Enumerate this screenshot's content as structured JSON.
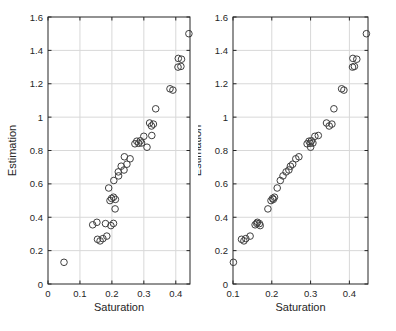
{
  "figure": {
    "background": "#ffffff",
    "title": ""
  },
  "colors": {
    "axis": "#262626",
    "tick_label": "#262626",
    "grid": "#d8d8d8",
    "marker_edge": "#3f3f3f",
    "plot_background": "#ffffff"
  },
  "chart_data": [
    {
      "type": "scatter",
      "title": "",
      "xlabel": "Saturation",
      "ylabel": "Estimation",
      "xlim": [
        0,
        0.4445
      ],
      "ylim": [
        0,
        1.6
      ],
      "xticks": [
        0,
        0.1,
        0.2,
        0.3,
        0.4
      ],
      "xticklabels": [
        "0",
        "0.1",
        "0.2",
        "0.3",
        "0.4"
      ],
      "yticks": [
        0,
        0.2,
        0.4,
        0.6,
        0.8,
        1.0,
        1.2,
        1.4,
        1.6
      ],
      "yticklabels": [
        "0",
        "0.2",
        "0.4",
        "0.6",
        "0.8",
        "1",
        "1.2",
        "1.4",
        "1.6"
      ],
      "grid": true,
      "legend": null,
      "marker": "open-circle",
      "points": [
        [
          0.05,
          0.13
        ],
        [
          0.163,
          0.258
        ],
        [
          0.155,
          0.268
        ],
        [
          0.172,
          0.272
        ],
        [
          0.184,
          0.287
        ],
        [
          0.14,
          0.355
        ],
        [
          0.153,
          0.37
        ],
        [
          0.18,
          0.362
        ],
        [
          0.197,
          0.35
        ],
        [
          0.205,
          0.363
        ],
        [
          0.21,
          0.45
        ],
        [
          0.194,
          0.5
        ],
        [
          0.199,
          0.513
        ],
        [
          0.205,
          0.52
        ],
        [
          0.211,
          0.507
        ],
        [
          0.19,
          0.575
        ],
        [
          0.206,
          0.62
        ],
        [
          0.221,
          0.648
        ],
        [
          0.22,
          0.672
        ],
        [
          0.238,
          0.683
        ],
        [
          0.229,
          0.706
        ],
        [
          0.247,
          0.718
        ],
        [
          0.257,
          0.75
        ],
        [
          0.239,
          0.762
        ],
        [
          0.272,
          0.84
        ],
        [
          0.278,
          0.856
        ],
        [
          0.284,
          0.843
        ],
        [
          0.289,
          0.858
        ],
        [
          0.293,
          0.845
        ],
        [
          0.31,
          0.82
        ],
        [
          0.3,
          0.885
        ],
        [
          0.325,
          0.89
        ],
        [
          0.318,
          0.965
        ],
        [
          0.324,
          0.947
        ],
        [
          0.33,
          0.958
        ],
        [
          0.337,
          1.05
        ],
        [
          0.382,
          1.17
        ],
        [
          0.391,
          1.162
        ],
        [
          0.408,
          1.352
        ],
        [
          0.418,
          1.347
        ],
        [
          0.407,
          1.3
        ],
        [
          0.416,
          1.304
        ],
        [
          0.441,
          1.5
        ]
      ]
    },
    {
      "type": "scatter",
      "title": "",
      "xlabel": "Saturation",
      "ylabel": "Estimation",
      "xlim": [
        0.1,
        0.448
      ],
      "ylim": [
        0,
        1.6
      ],
      "xticks": [
        0.1,
        0.2,
        0.3,
        0.4
      ],
      "xticklabels": [
        "0.1",
        "0.2",
        "0.3",
        "0.4"
      ],
      "yticks": [
        0,
        0.2,
        0.4,
        0.6,
        0.8,
        1.0,
        1.2,
        1.4,
        1.6
      ],
      "yticklabels": [
        "0",
        "0.2",
        "0.4",
        "0.6",
        "0.8",
        "1",
        "1.2",
        "1.4",
        "1.6"
      ],
      "grid": true,
      "legend": null,
      "marker": "open-circle",
      "points": [
        [
          0.101,
          0.13
        ],
        [
          0.128,
          0.258
        ],
        [
          0.122,
          0.268
        ],
        [
          0.133,
          0.272
        ],
        [
          0.144,
          0.287
        ],
        [
          0.157,
          0.355
        ],
        [
          0.163,
          0.37
        ],
        [
          0.168,
          0.362
        ],
        [
          0.17,
          0.35
        ],
        [
          0.161,
          0.363
        ],
        [
          0.19,
          0.45
        ],
        [
          0.198,
          0.5
        ],
        [
          0.202,
          0.513
        ],
        [
          0.207,
          0.52
        ],
        [
          0.204,
          0.507
        ],
        [
          0.214,
          0.575
        ],
        [
          0.222,
          0.62
        ],
        [
          0.229,
          0.648
        ],
        [
          0.237,
          0.672
        ],
        [
          0.244,
          0.683
        ],
        [
          0.248,
          0.706
        ],
        [
          0.254,
          0.718
        ],
        [
          0.262,
          0.75
        ],
        [
          0.27,
          0.762
        ],
        [
          0.291,
          0.84
        ],
        [
          0.296,
          0.856
        ],
        [
          0.299,
          0.843
        ],
        [
          0.302,
          0.858
        ],
        [
          0.306,
          0.845
        ],
        [
          0.3,
          0.82
        ],
        [
          0.311,
          0.885
        ],
        [
          0.32,
          0.89
        ],
        [
          0.341,
          0.965
        ],
        [
          0.348,
          0.947
        ],
        [
          0.355,
          0.958
        ],
        [
          0.36,
          1.05
        ],
        [
          0.38,
          1.17
        ],
        [
          0.386,
          1.162
        ],
        [
          0.409,
          1.352
        ],
        [
          0.419,
          1.347
        ],
        [
          0.408,
          1.3
        ],
        [
          0.413,
          1.304
        ],
        [
          0.444,
          1.5
        ]
      ]
    }
  ]
}
